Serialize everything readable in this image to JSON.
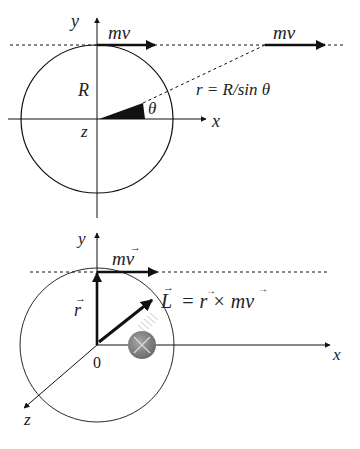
{
  "top_diagram": {
    "axis_y_label": "y",
    "axis_x_label": "x",
    "axis_z_label": "z",
    "radius_label": "R",
    "angle_label": "θ",
    "momentum_label_1": "mv",
    "momentum_label_2": "mv",
    "distance_formula": "r = R/sin θ"
  },
  "bottom_diagram": {
    "axis_y_label": "y",
    "axis_x_label": "x",
    "axis_z_label": "z",
    "origin_label": "0",
    "position_vector_label": "r",
    "momentum_label": "mv",
    "angular_momentum_formula_lhs": "L",
    "angular_momentum_formula_rhs": "= r × mv",
    "into_page_symbol": "×"
  },
  "colors": {
    "ink": "#111111",
    "marker_fill": "#8a8a8a",
    "marker_cross": "#d8d8d8"
  }
}
